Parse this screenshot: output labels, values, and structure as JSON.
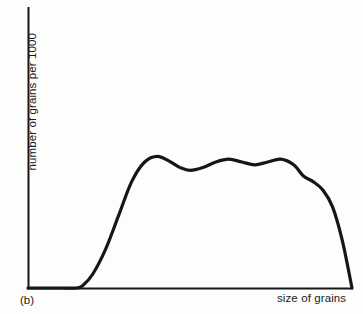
{
  "figure": {
    "caption": "(b)",
    "background_color": "#fdfdfc",
    "ink_color": "#161616"
  },
  "chart_data": {
    "type": "line",
    "title": "",
    "subtitle": "",
    "xlabel": "size of grains",
    "ylabel": "number of grains  per 1000",
    "xlim": [
      0,
      100
    ],
    "ylim": [
      0,
      100
    ],
    "grid": false,
    "legend": false,
    "legend_position": "none",
    "axis_ticks": {
      "x": [],
      "y": []
    },
    "annotations": [
      "(b)"
    ],
    "series": [
      {
        "name": "grain size frequency",
        "color": "#161616",
        "x": [
          0,
          5,
          10,
          15,
          17,
          20,
          24,
          28,
          32,
          36,
          40,
          44,
          47,
          50,
          54,
          58,
          62,
          66,
          70,
          74,
          78,
          82,
          85,
          88,
          91,
          94,
          97,
          100
        ],
        "values": [
          0,
          0,
          0,
          0,
          1,
          5,
          14,
          26,
          38,
          45,
          47,
          45,
          43,
          42,
          43,
          45,
          46,
          45,
          44,
          45,
          46,
          44,
          40,
          38,
          35,
          29,
          17,
          0
        ]
      }
    ]
  },
  "axes": {
    "x_axis_name": "x-axis-line",
    "y_axis_name": "y-axis-line",
    "origin_px": [
      28,
      288
    ],
    "x_end_px": [
      352,
      288
    ],
    "y_top_px": [
      28,
      8
    ]
  }
}
